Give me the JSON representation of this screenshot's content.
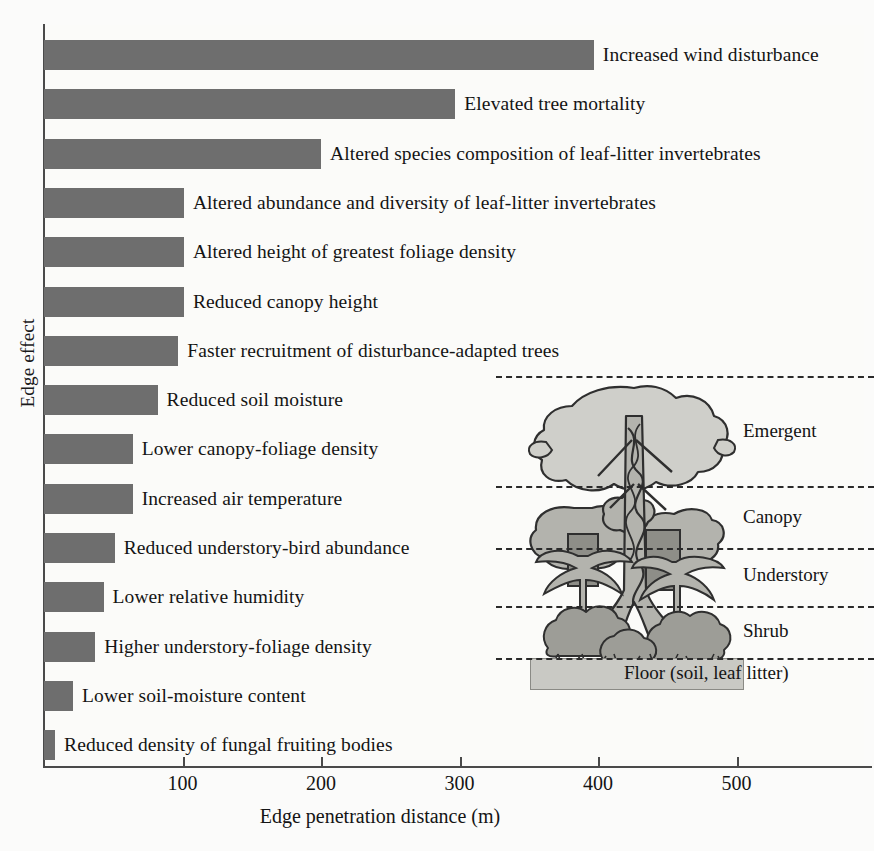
{
  "chart_data": {
    "type": "bar",
    "orientation": "horizontal",
    "title": "",
    "xlabel": "Edge penetration distance (m)",
    "ylabel": "Edge effect",
    "xlim": [
      0,
      595
    ],
    "xticks": [
      100,
      200,
      300,
      400,
      500
    ],
    "grid": false,
    "legend": "none",
    "bar_color": "#6e6e6e",
    "categories": [
      "Increased wind disturbance",
      "Elevated tree mortality",
      "Altered species composition of leaf-litter invertebrates",
      "Altered abundance and diversity of leaf-litter invertebrates",
      "Altered height of greatest foliage density",
      "Reduced canopy height",
      "Faster recruitment of disturbance-adapted trees",
      "Reduced soil moisture",
      "Lower canopy-foliage density",
      "Increased air temperature",
      "Reduced understory-bird abundance",
      "Lower relative humidity",
      "Higher understory-foliage density",
      "Lower soil-moisture content",
      "Reduced density of fungal fruiting bodies"
    ],
    "values": [
      397,
      297,
      200,
      101,
      101,
      101,
      97,
      82,
      64,
      64,
      51,
      43,
      37,
      21,
      8
    ]
  },
  "axes": {
    "y_title": "Edge effect",
    "x_title": "Edge penetration distance (m)",
    "x_tick_labels": [
      "100",
      "200",
      "300",
      "400",
      "500"
    ]
  },
  "inset": {
    "name": "forest-strata-diagram",
    "strata": [
      {
        "label": "Emergent"
      },
      {
        "label": "Canopy"
      },
      {
        "label": "Understory"
      },
      {
        "label": "Shrub"
      }
    ],
    "floor_label": "Floor (soil, leaf litter)"
  }
}
